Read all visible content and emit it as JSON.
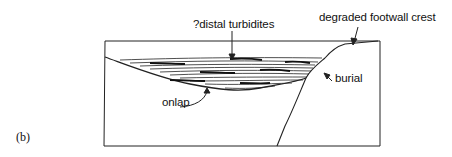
{
  "figure": {
    "panel_label": "(b)",
    "labels": {
      "turbidites": "?distal turbidites",
      "footwall": "degraded footwall crest",
      "burial": "burial",
      "onlap": "onlap"
    }
  }
}
